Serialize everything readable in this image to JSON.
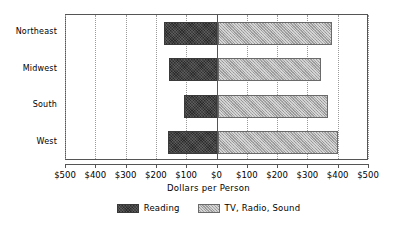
{
  "chart_data": {
    "type": "bar",
    "orientation": "horizontal",
    "layout": "diverging",
    "title": "",
    "subtitle": "",
    "xlabel": "Dollars per Person",
    "ylabel": "",
    "categories": [
      "Northeast",
      "Midwest",
      "South",
      "West"
    ],
    "series": [
      {
        "name": "Reading",
        "direction": "left",
        "color": "#2b2b2b",
        "values": [
          175,
          160,
          112,
          165
        ]
      },
      {
        "name": "TV, Radio, Sound",
        "direction": "right",
        "color": "#a8a8a8",
        "values": [
          378,
          342,
          364,
          398
        ]
      }
    ],
    "xlim": [
      -500,
      500
    ],
    "xticks": [
      -500,
      -400,
      -300,
      -200,
      -100,
      0,
      100,
      200,
      300,
      400,
      500
    ],
    "xtick_labels": [
      "$500",
      "$400",
      "$300",
      "$200",
      "$100",
      "$0",
      "$100",
      "$200",
      "$300",
      "$400",
      "$500"
    ],
    "grid": true,
    "grid_style": "dotted-vertical",
    "legend_position": "bottom-center",
    "legend_entries": [
      "Reading",
      "TV, Radio, Sound"
    ]
  },
  "colors": {
    "axis": "#555555",
    "grid": "#9a9a9a",
    "reading": "#2b2b2b",
    "tv_radio_sound": "#a8a8a8",
    "background": "#ffffff"
  }
}
